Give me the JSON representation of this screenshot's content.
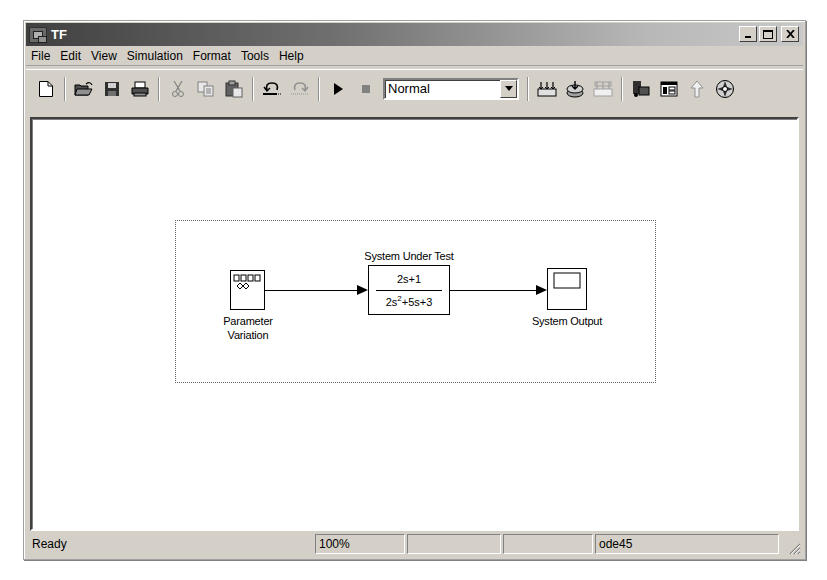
{
  "window": {
    "title": "TF",
    "controls": {
      "minimize": "_",
      "maximize": "□",
      "close": "✕"
    }
  },
  "menubar": {
    "items": [
      "File",
      "Edit",
      "View",
      "Simulation",
      "Format",
      "Tools",
      "Help"
    ]
  },
  "toolbar": {
    "buttons": [
      {
        "name": "new-model",
        "icon": "new-document-icon",
        "enabled": true
      },
      {
        "name": "open-model",
        "icon": "open-folder-icon",
        "enabled": true
      },
      {
        "name": "save-model",
        "icon": "floppy-disk-icon",
        "enabled": true
      },
      {
        "name": "print-model",
        "icon": "printer-icon",
        "enabled": true
      },
      {
        "name": "cut",
        "icon": "scissors-icon",
        "enabled": false
      },
      {
        "name": "copy",
        "icon": "copy-icon",
        "enabled": false
      },
      {
        "name": "paste",
        "icon": "paste-icon",
        "enabled": true
      },
      {
        "name": "undo",
        "icon": "undo-icon",
        "enabled": true
      },
      {
        "name": "redo",
        "icon": "redo-icon",
        "enabled": false
      },
      {
        "name": "start-simulation",
        "icon": "play-icon",
        "enabled": true
      },
      {
        "name": "stop-simulation",
        "icon": "stop-icon",
        "enabled": false
      },
      {
        "name": "build-all",
        "icon": "build-icon",
        "enabled": true
      },
      {
        "name": "update-diagram",
        "icon": "update-diagram-icon",
        "enabled": true
      },
      {
        "name": "build-subsystem",
        "icon": "build-subsystem-icon",
        "enabled": false
      },
      {
        "name": "library-browser",
        "icon": "library-browser-icon",
        "enabled": true
      },
      {
        "name": "model-explorer",
        "icon": "model-explorer-icon",
        "enabled": true
      },
      {
        "name": "go-to-parent",
        "icon": "up-arrow-icon",
        "enabled": false
      },
      {
        "name": "debug",
        "icon": "debug-icon",
        "enabled": true
      }
    ],
    "simulation_mode": "Normal"
  },
  "diagram": {
    "blocks": {
      "parameter_variation": {
        "label_line1": "Parameter",
        "label_line2": "Variation"
      },
      "system_under_test": {
        "label": "System Under Test",
        "numerator": "2s+1",
        "denominator_base": "2s",
        "denominator_exp": "2",
        "denominator_rest": "+5s+3"
      },
      "system_output": {
        "label": "System Output"
      }
    }
  },
  "statusbar": {
    "status": "Ready",
    "zoom": "100%",
    "field3": "",
    "field4": "",
    "solver": "ode45"
  }
}
